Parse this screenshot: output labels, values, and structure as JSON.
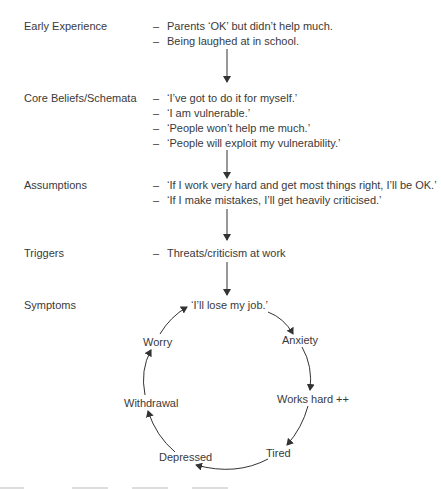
{
  "stages": [
    {
      "label": "Early Experience",
      "items": [
        "Parents ‘OK’ but didn’t help much.",
        "Being laughed at in school."
      ]
    },
    {
      "label": "Core Beliefs/Schemata",
      "items": [
        "‘I’ve got to do it for myself.’",
        "‘I am vulnerable.’",
        "‘People won’t help me much.’",
        "‘People will exploit my vulnerability.’"
      ]
    },
    {
      "label": "Assumptions",
      "items": [
        "‘If I work very hard and get most things right, I’ll be OK.’",
        "‘If I make mistakes, I’ll get heavily criticised.’"
      ]
    },
    {
      "label": "Triggers",
      "items": [
        "Threats/criticism at work"
      ]
    },
    {
      "label": "Symptoms",
      "items": []
    }
  ],
  "dash": "–",
  "cycle": {
    "nodes": [
      "‘I’ll lose my job.’",
      "Anxiety",
      "Works hard ++",
      "Tired",
      "Depressed",
      "Withdrawal",
      "Worry"
    ]
  },
  "colors": {
    "text": "#3a3a3a",
    "lines": "#333333",
    "background": "#ffffff"
  }
}
